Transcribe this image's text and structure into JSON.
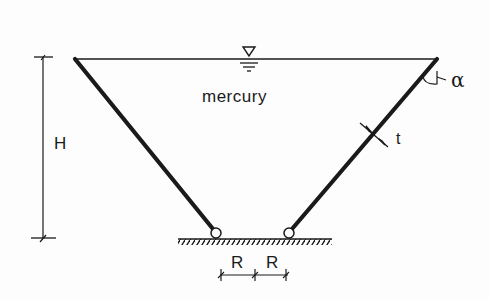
{
  "diagram": {
    "type": "conical tank cross-section",
    "fluid_label": "mercury",
    "labels": {
      "height": "H",
      "thickness": "t",
      "angle": "α",
      "radius_left": "R",
      "radius_right": "R"
    },
    "colors": {
      "ink": "#1a1a1a",
      "background": "#fdfdfd"
    }
  }
}
